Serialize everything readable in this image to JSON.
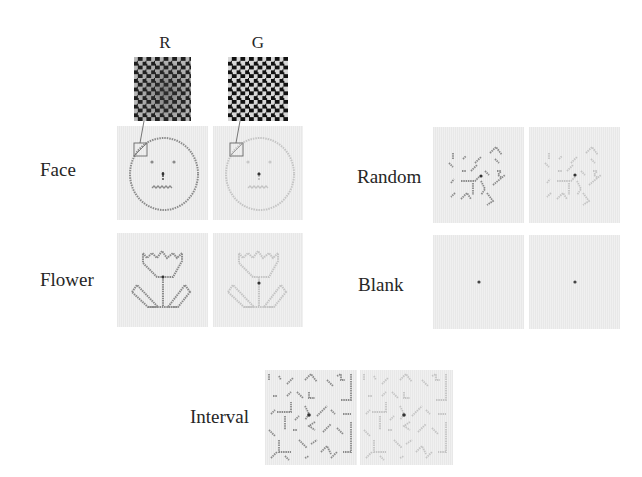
{
  "columns": {
    "r_label": "R",
    "g_label": "G"
  },
  "conditions": {
    "face": {
      "label": "Face"
    },
    "flower": {
      "label": "Flower"
    },
    "random": {
      "label": "Random"
    },
    "blank": {
      "label": "Blank"
    },
    "interval": {
      "label": "Interval"
    }
  },
  "colors": {
    "panel_bg": "#f0f0f0",
    "stroke_r": "#8a8a8a",
    "stroke_g": "#c4c4c4",
    "fixation": "#333333",
    "inset_dark": "#111111",
    "inset_light": "#d9d9d9"
  },
  "magnifier": {
    "source_box": "top-left of face contour",
    "zoom_view": "checkerboard texture"
  }
}
